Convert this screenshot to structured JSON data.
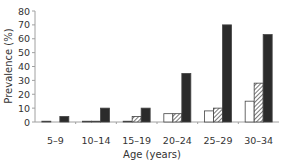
{
  "chart_data": {
    "type": "bar",
    "title": "",
    "xlabel": "Age (years)",
    "ylabel": "Prevalence (%)",
    "ylim": [
      0,
      80
    ],
    "yticks": [
      0,
      10,
      20,
      30,
      40,
      50,
      60,
      70,
      80
    ],
    "grid": false,
    "legend": null,
    "categories": [
      "5–9",
      "10–14",
      "15–19",
      "20–24",
      "25–29",
      "30–34"
    ],
    "series": [
      {
        "name": "white",
        "fill": "#ffffff",
        "pattern": "none",
        "values": [
          0.5,
          0.5,
          0.5,
          6,
          8,
          15
        ]
      },
      {
        "name": "hatched",
        "fill": "#9a9a9a",
        "pattern": "diagonal-hatch",
        "values": [
          0,
          0.5,
          4,
          6,
          10,
          28
        ]
      },
      {
        "name": "black",
        "fill": "#2b2b2b",
        "pattern": "none",
        "values": [
          4,
          10,
          10,
          35,
          70,
          63
        ]
      }
    ]
  },
  "colors": {
    "axis": "#a0a0a0",
    "text": "#333333",
    "bar_outline": "#444444"
  }
}
